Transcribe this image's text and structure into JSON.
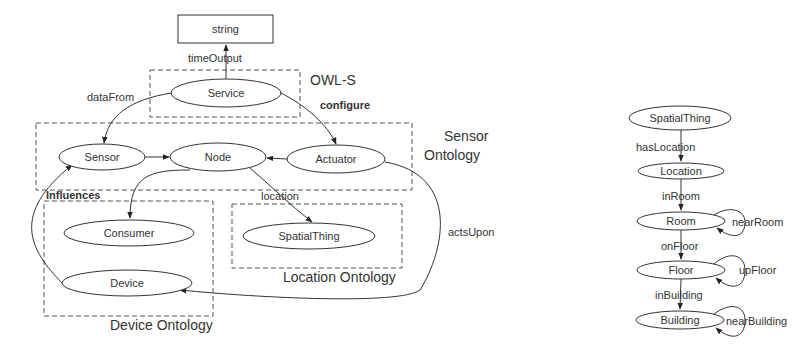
{
  "left_diagram": {
    "groups": {
      "owls": {
        "label": "OWL-S"
      },
      "sensor": {
        "label_line1": "Sensor",
        "label_line2": "Ontology"
      },
      "device": {
        "label": "Device Ontology"
      },
      "location": {
        "label": "Location Ontology"
      }
    },
    "nodes": {
      "string": "string",
      "service": "Service",
      "sensor": "Sensor",
      "node": "Node",
      "actuator": "Actuator",
      "consumer": "Consumer",
      "device": "Device",
      "spatialthing": "SpatialThing"
    },
    "edges": {
      "time_output": "timeOutput",
      "data_from": "dataFrom",
      "configure": "configure",
      "influences": "Influences",
      "location": "location",
      "acts_upon": "actsUpon"
    }
  },
  "right_diagram": {
    "nodes": {
      "spatialthing": "SpatialThing",
      "location": "Location",
      "room": "Room",
      "floor": "Floor",
      "building": "Building"
    },
    "edges": {
      "has_location": "hasLocation",
      "in_room": "inRoom",
      "near_room": "nearRoom",
      "on_floor": "onFloor",
      "up_floor": "upFloor",
      "in_building": "inBuilding",
      "near_building": "nearBuilding"
    }
  },
  "colors": {
    "stroke": "#333333",
    "dashed": "#555555",
    "background": "#ffffff"
  }
}
